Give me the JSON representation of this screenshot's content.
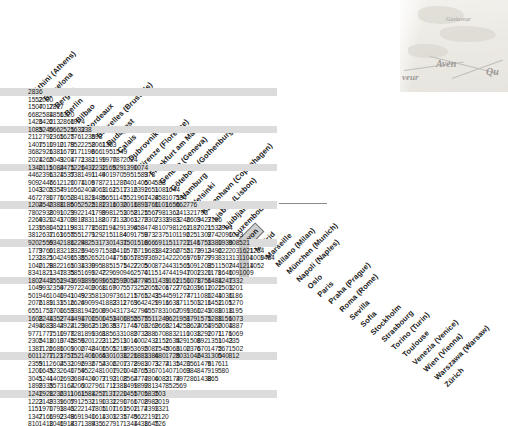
{
  "document": {
    "type": "distance-matrix",
    "title": "European city road distance matrix",
    "units": "kilometres",
    "selected_city": "Luxembourg",
    "map_inset": {
      "visible": true,
      "position": "top-right",
      "labels": [
        "Aven",
        "veur",
        "Qu",
        "Gustavear"
      ]
    }
  },
  "colors": {
    "row_shade": "#dcdcdc",
    "selection_fill": "#cfcfcf",
    "selection_border": "#6e6e6e",
    "text": "#141414",
    "background": "#ffffff"
  },
  "cities": [
    "Amsterdam",
    "Athini (Athens)",
    "Barcelona",
    "Bergen",
    "Berlin",
    "Bilbao",
    "Bordeaux",
    "Bruxelles (Brussels)",
    "Budapest",
    "Calais",
    "Dubrovnik",
    "Firenze (Florence)",
    "Frankfurt am Main",
    "Genève (Geneva)",
    "Göteborg (Gothenburg)",
    "Hamburg",
    "Helsinki",
    "København (Copenhagen)",
    "Lisboa (Lisbon)",
    "Ljubljana",
    "Luxembourg",
    "Lyon",
    "Madrid",
    "Marseille"
  ],
  "row_labels": [
    "Athini (Athens)",
    "Barcelona",
    "Bergen",
    "Berlin",
    "Bilbao",
    "Bordeaux",
    "Bruxelles (Brussels)",
    "Budapest",
    "Calais",
    "Dubrovnik",
    "Firenze (Florence)",
    "Frankfurt am Main",
    "Genève (Geneva)",
    "Göteborg (Gothenburg)",
    "Hamburg",
    "Helsinki",
    "København (Copenhagen)",
    "Lisboa (Lisbon)",
    "Ljubljana",
    "Luxembourg",
    "Lyon",
    "Madrid",
    "Marseille",
    "Milano (Milan)",
    "München (Munich)",
    "Napoli (Naples)",
    "Oslo",
    "Paris",
    "Praha (Prague)",
    "Roma (Rome)",
    "Sevilla",
    "Sofia",
    "Stockholm",
    "Strasbourg",
    "Torino (Turin)",
    "Toulouse",
    "Venezia (Venice)",
    "Wien (Vienna)",
    "Warszawa (Warsaw)",
    "Zürich"
  ],
  "selected_column_index": 20,
  "shaded_row_period": 5,
  "rows": [
    [
      2836
    ],
    [
      1552,
      2090
    ],
    [
      1507,
      4017,
      2817
    ],
    [
      668,
      2584,
      1856,
      1320
    ],
    [
      1426,
      3422,
      613,
      2866,
      1974
    ],
    [
      1085,
      3240,
      566,
      2525,
      1632,
      338
    ],
    [
      211,
      2792,
      1365,
      1625,
      776,
      1235,
      893
    ],
    [
      1407,
      1510,
      1910,
      2179,
      852,
      2258,
      2061,
      1363
    ],
    [
      368,
      2926,
      1381,
      1672,
      917,
      1196,
      866,
      195,
      1549
    ],
    [
      2024,
      1265,
      2049,
      3204,
      1771,
      2381,
      2199,
      1970,
      787,
      2024
    ],
    [
      1340,
      2115,
      1084,
      2475,
      1226,
      1432,
      1232,
      1165,
      929,
      1390,
      1074
    ],
    [
      446,
      2396,
      1324,
      1537,
      538,
      1491,
      1149,
      401,
      970,
      595,
      1583,
      973
    ],
    [
      909,
      2446,
      761,
      2120,
      1074,
      1109,
      678,
      721,
      1280,
      740,
      1405,
      604,
      588
    ],
    [
      1043,
      3205,
      2354,
      791,
      656,
      2404,
      2063,
      1162,
      1517,
      1316,
      2392,
      1651,
      1081,
      1644
    ],
    [
      467,
      2780,
      1776,
      1050,
      284,
      1828,
      1486,
      565,
      1145,
      752,
      1967,
      1428,
      458,
      1071,
      584
    ],
    [
      1204,
      2540,
      2388,
      1186,
      505,
      2525,
      2182,
      1316,
      1030,
      2016,
      1893,
      1766,
      1101,
      1656,
      662,
      776
    ],
    [
      780,
      2938,
      2091,
      1029,
      392,
      2141,
      1799,
      898,
      1253,
      1058,
      2125,
      1567,
      798,
      1361,
      241,
      321,
      793
    ],
    [
      2269,
      4320,
      1241,
      3709,
      2817,
      883,
      1188,
      2077,
      3133,
      2061,
      3279,
      2307,
      2333,
      1983,
      3246,
      2609,
      3427,
      3156
    ],
    [
      1239,
      1580,
      1451,
      2119,
      983,
      1778,
      1587,
      1191,
      429,
      1394,
      658,
      474,
      810,
      798,
      1262,
      1187,
      2021,
      1533,
      2904
    ],
    [
      381,
      2637,
      1163,
      1655,
      755,
      1271,
      929,
      215,
      1184,
      409,
      1758,
      973,
      237,
      510,
      1192,
      625,
      1302,
      974,
      2090,
      1033
    ],
    [
      920,
      2559,
      634,
      2186,
      1224,
      982,
      531,
      730,
      1431,
      750,
      1518,
      666,
      691,
      151,
      1722,
      1146,
      1753,
      1380,
      1936,
      908,
      521
    ],
    [
      1779,
      3760,
      618,
      3219,
      2326,
      394,
      697,
      1586,
      2410,
      1576,
      2719,
      1683,
      1842,
      1360,
      2755,
      2179,
      2913,
      2492,
      622,
      2038,
      1621,
      1234
    ],
    [
      1231,
      2821,
      504,
      2496,
      1535,
      852,
      652,
      1044,
      1756,
      1057,
      1857,
      936,
      921,
      422,
      2069,
      1769,
      1727,
      993,
      831,
      313,
      1104,
      1009,
      1484
    ],
    [
      1040,
      2128,
      982,
      2165,
      1034,
      1330,
      995,
      885,
      1575,
      1427,
      2205,
      500,
      872,
      443,
      1561,
      509,
      1203,
      851,
      1502,
      744,
      1214,
      1052
    ],
    [
      834,
      1821,
      1347,
      1835,
      585,
      1699,
      1242,
      729,
      690,
      946,
      2570,
      411,
      514,
      744,
      1947,
      1002,
      1320,
      1178,
      1646,
      1096,
      1009
    ],
    [
      1807,
      2443,
      1551,
      2943,
      1693,
      1899,
      1699,
      1652,
      1599,
      2054,
      2774,
      951,
      1439,
      1161,
      2150,
      1078,
      1756,
      1484,
      1247,
      1332
    ],
    [
      1049,
      993,
      2359,
      472,
      972,
      2409,
      2068,
      1167,
      907,
      557,
      3252,
      2055,
      1206,
      1727,
      2761,
      2039,
      1612,
      1022,
      1503,
      1201
    ],
    [
      501,
      946,
      1040,
      1941,
      1049,
      923,
      581,
      309,
      736,
      1215,
      1765,
      1243,
      354,
      459,
      1274,
      771,
      1080,
      1244,
      1036,
      1186
    ],
    [
      2076,
      2189,
      1131,
      3516,
      2624,
      690,
      994,
      1883,
      2311,
      2769,
      364,
      2429,
      1916,
      1631,
      871,
      1503,
      1216,
      1452,
      1105,
      1270
    ],
    [
      655,
      1753,
      1700,
      1659,
      338,
      1942,
      1600,
      890,
      431,
      734,
      2794,
      655,
      783,
      1067,
      2099,
      1360,
      1243,
      1088,
      1018,
      1195
    ],
    [
      1608,
      2244,
      1352,
      2744,
      1494,
      1700,
      1500,
      1453,
      1400,
      1855,
      2575,
      751,
      1240,
      962,
      1951,
      879,
      1575,
      1288,
      1156,
      1073
    ],
    [
      2493,
      4683,
      3844,
      2924,
      2129,
      3862,
      3519,
      2635,
      837,
      1745,
      4760,
      3269,
      2660,
      3214,
      4250,
      3624,
      2054,
      1950,
      2004,
      1887
    ],
    [
      977,
      1777,
      1510,
      1978,
      728,
      1899,
      1361,
      885,
      633,
      1089,
      2733,
      288,
      670,
      883,
      2110,
      1038,
      1292,
      1071,
      1176,
      1069
    ],
    [
      2305,
      2418,
      1010,
      3745,
      2856,
      920,
      1223,
      2112,
      2511,
      3016,
      400,
      2431,
      2152,
      1634,
      529,
      1506,
      892,
      1351,
      1043,
      235
    ],
    [
      1387,
      1126,
      2686,
      1009,
      1000,
      2748,
      2406,
      1505,
      1214,
      595,
      3695,
      2087,
      1545,
      2066,
      3100,
      2376,
      670,
      1472,
      567,
      1502
    ],
    [
      601,
      1277,
      1123,
      1751,
      752,
      1406,
      1065,
      430,
      1038,
      1226,
      1883,
      1386,
      480,
      1725,
      803,
      1046,
      243,
      1300,
      540,
      812
    ],
    [
      2359,
      511,
      2604,
      2531,
      2096,
      2936,
      2754,
      2306,
      2207,
      1378,
      2983,
      1073,
      3274,
      2135,
      1420,
      356,
      1476,
      917,
      611
    ],
    [
      1200,
      1645,
      323,
      2640,
      1759,
      452,
      248,
      1007,
      1920,
      1046,
      2765,
      536,
      701,
      407,
      1063,
      984,
      847,
      919,
      580
    ],
    [
      3041,
      5241,
      4402,
      1693,
      2687,
      4420,
      4077,
      3193,
      2108,
      2564,
      2772,
      4806,
      4083,
      2174,
      397,
      286,
      1438,
      865
    ],
    [
      1899,
      2335,
      357,
      3164,
      2203,
      602,
      796,
      1711,
      2388,
      1499,
      1892,
      981,
      347,
      852,
      569
    ],
    [
      1242,
      1928,
      1236,
      2311,
      1061,
      1584,
      1257,
      1137,
      1220,
      1455,
      1705,
      1835,
      703
    ],
    [
      1223,
      2149,
      2339,
      1607,
      591,
      2531,
      2190,
      1332,
      1290,
      1766,
      1708,
      2983,
      2019
    ],
    [
      1151,
      1970,
      1793,
      1843,
      622,
      2147,
      1805,
      1107,
      1163,
      1502,
      1174,
      2393,
      1321
    ],
    [
      1347,
      2166,
      1992,
      2348,
      969,
      1940,
      1614,
      1303,
      1235,
      1745,
      962,
      2192,
      1120
    ],
    [
      810,
      1418,
      1046,
      1914,
      837,
      1384,
      935,
      627,
      917,
      1344,
      1438,
      1645,
      726
    ]
  ]
}
